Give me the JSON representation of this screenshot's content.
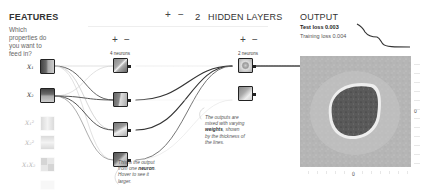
{
  "features": {
    "title": "FEATURES",
    "question": "Which properties do you want to feed in?",
    "items": [
      {
        "label": "X₁",
        "active": true
      },
      {
        "label": "X₂",
        "active": true
      },
      {
        "label": "X₁²",
        "active": false
      },
      {
        "label": "X₂²",
        "active": false
      },
      {
        "label": "X₁X₂",
        "active": false
      },
      {
        "label": "",
        "active": false
      }
    ]
  },
  "hidden_layers": {
    "add_label": "+",
    "remove_label": "−",
    "count": "2",
    "title": "HIDDEN LAYERS",
    "layers": [
      {
        "add": "+",
        "remove": "−",
        "neurons_label": "4 neurons"
      },
      {
        "add": "+",
        "remove": "−",
        "neurons_label": "2 neurons"
      }
    ]
  },
  "annotations": {
    "neuron_note": [
      "This is the output",
      "from one neuron.",
      "Hover to see it",
      "larger."
    ],
    "neuron_note_bold": "neuron",
    "weights_note": [
      "The outputs are",
      "mixed with varying",
      "weights, shown",
      "by the thickness of",
      "the lines."
    ],
    "weights_note_bold": "weights"
  },
  "output": {
    "title": "OUTPUT",
    "test_loss_label": "Test loss",
    "test_loss": "0.003",
    "training_loss_label": "Training loss",
    "training_loss": "0.004",
    "axis_zero_right": "0",
    "axis_zero_bottom": "0"
  },
  "colors": {
    "node_border": "#222222",
    "link_dark": "#333333",
    "link_light": "#bbbbbb",
    "heatmap_bg": "#b8b8b8",
    "heatmap_blob": "#5a5a5a"
  }
}
